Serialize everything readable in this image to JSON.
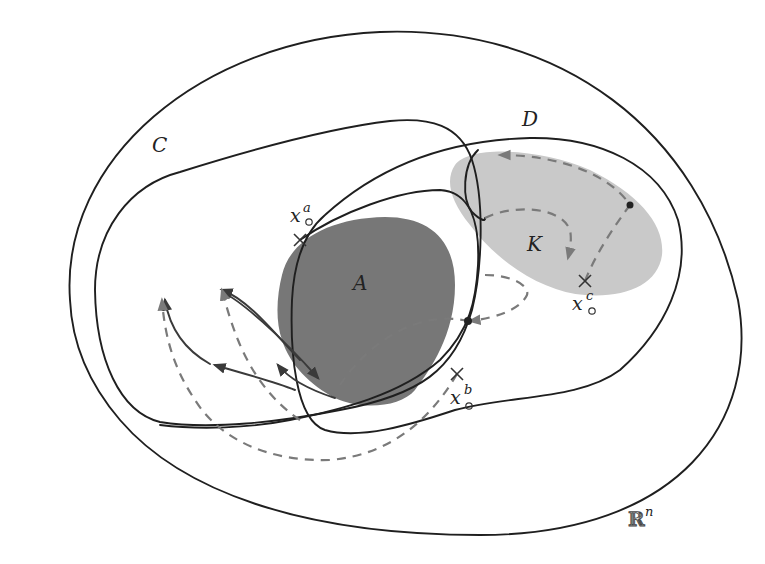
{
  "figure": {
    "colors": {
      "outline": "#1f1f1f",
      "set_A_fill": "#777777",
      "set_K_fill": "#c9c9c9",
      "dashed_trajectory": "#7a7a7a",
      "solid_trajectory": "#3a3a3a",
      "background": "#ffffff"
    },
    "labels": {
      "space": "ℝ",
      "space_exp": "n",
      "set_C": "C",
      "set_D": "D",
      "set_A": "A",
      "set_K": "K",
      "point_a_base": "x",
      "point_a_sup": "a",
      "point_b_base": "x",
      "point_b_sup": "b",
      "point_c_base": "x",
      "point_c_sup": "c"
    },
    "points": [
      {
        "name": "x_a",
        "marker": "cross",
        "x": 300,
        "y": 240
      },
      {
        "name": "x_b",
        "marker": "cross",
        "x": 457,
        "y": 374
      },
      {
        "name": "x_c",
        "marker": "cross",
        "x": 585,
        "y": 281
      }
    ],
    "dots": [
      {
        "x": 630,
        "y": 205
      },
      {
        "x": 468,
        "y": 321
      }
    ]
  }
}
